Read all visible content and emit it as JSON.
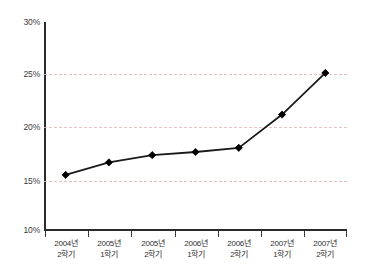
{
  "chart_data": {
    "type": "line",
    "title": "",
    "subtitle": "",
    "xlabel": "",
    "ylabel": "",
    "categories": [
      "2004년\n2학기",
      "2005년\n1학기",
      "2005년\n2학기",
      "2006년\n1학기",
      "2006년\n2학기",
      "2007년\n1학기",
      "2007년\n2학기"
    ],
    "category_lines": [
      [
        "2004년",
        "2학기"
      ],
      [
        "2005년",
        "1학기"
      ],
      [
        "2005년",
        "2학기"
      ],
      [
        "2006년",
        "1학기"
      ],
      [
        "2006년",
        "2학기"
      ],
      [
        "2007년",
        "1학기"
      ],
      [
        "2007년",
        "2학기"
      ]
    ],
    "values": [
      15.3,
      16.5,
      17.2,
      17.5,
      17.9,
      21.1,
      25.1
    ],
    "ylim": [
      10,
      30
    ],
    "ytick_values": [
      30,
      25,
      20,
      15,
      10
    ],
    "ytick_labels": [
      "30%",
      "25%",
      "20%",
      "15%",
      "10%"
    ],
    "grid": {
      "horizontal": true,
      "at_values": [
        25,
        20,
        15
      ],
      "style": "dashed",
      "color": "#e2b9b9"
    },
    "legend": {
      "show": false,
      "position": "none",
      "entries": []
    },
    "series": [
      {
        "name": "series-1",
        "values": [
          15.3,
          16.5,
          17.2,
          17.5,
          17.9,
          21.1,
          25.1
        ],
        "line_color": "#1a1a1a",
        "marker": "diamond",
        "marker_color": "#000000"
      }
    ],
    "annotations": []
  },
  "axes": {
    "y_axis_color": "#2b2b2b",
    "x_axis_color": "#2b2b2b"
  }
}
